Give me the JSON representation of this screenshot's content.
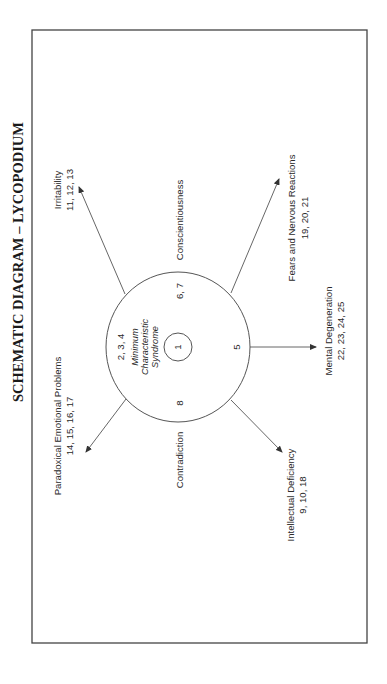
{
  "title": "SCHEMATIC DIAGRAM – LYCOPODIUM",
  "center": {
    "core_number": "1",
    "core_label_lines": [
      "Minimum",
      "Characteristic",
      "Syndrome"
    ],
    "inner_numbers": {
      "upper_left": "2, 3, 4",
      "upper_right": "6, 7",
      "right": "5",
      "lower": "8"
    }
  },
  "side_labels": {
    "conscientiousness": "Conscientiousness",
    "contradiction": "Contradiction"
  },
  "branches": [
    {
      "id": "irritability",
      "label": "Irritability",
      "numbers": "11, 12, 13"
    },
    {
      "id": "paradoxical",
      "label": "Paradoxical Emotional Problems",
      "numbers": "14, 15, 16, 17"
    },
    {
      "id": "fears",
      "label": "Fears and Nervous Reactions",
      "numbers": "19, 20, 21"
    },
    {
      "id": "mental",
      "label": "Mental Degeneration",
      "numbers": "22, 23, 24, 25"
    },
    {
      "id": "intellectual",
      "label": "Intellectual Deficiency",
      "numbers": "9, 10, 18"
    }
  ],
  "colors": {
    "line": "#555555",
    "text": "#2a2a2a",
    "background": "#ffffff"
  }
}
